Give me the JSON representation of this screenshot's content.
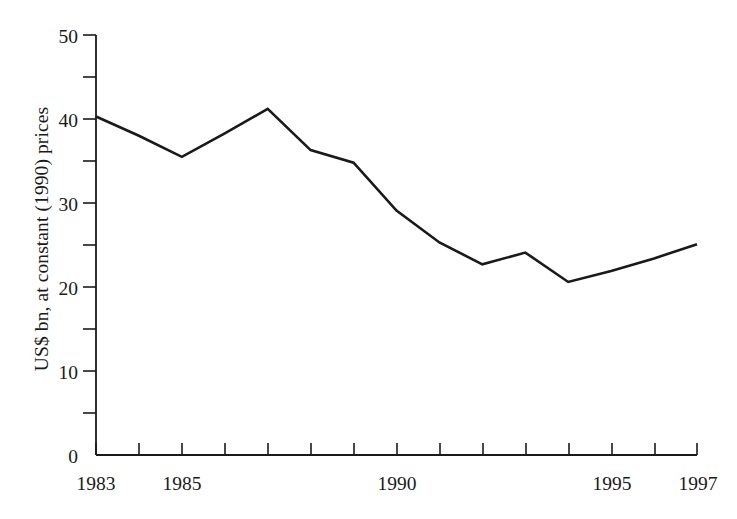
{
  "chart_data": {
    "type": "line",
    "title": "",
    "subtitle": "",
    "xlabel": "",
    "ylabel": "US$ bn, at constant (1990) prices",
    "x": [
      1983,
      1984,
      1985,
      1986,
      1987,
      1988,
      1989,
      1990,
      1991,
      1992,
      1993,
      1994,
      1995,
      1996,
      1997
    ],
    "values": [
      40.3,
      38.0,
      35.5,
      38.3,
      41.2,
      36.3,
      34.8,
      29.1,
      25.3,
      22.7,
      24.1,
      20.6,
      21.9,
      23.4,
      25.1
    ],
    "series": [
      {
        "name": "US$ bn, at constant (1990) prices",
        "values": [
          40.3,
          38.0,
          35.5,
          38.3,
          41.2,
          36.3,
          34.8,
          29.1,
          25.3,
          22.7,
          24.1,
          20.6,
          21.9,
          23.4,
          25.1
        ]
      }
    ],
    "xlim": [
      1983,
      1997
    ],
    "ylim": [
      0,
      50
    ],
    "x_tick_values": [
      1983,
      1984,
      1985,
      1986,
      1987,
      1988,
      1989,
      1990,
      1991,
      1992,
      1993,
      1994,
      1995,
      1996,
      1997
    ],
    "x_tick_labels_shown": [
      "1983",
      "1985",
      "1990",
      "1995",
      "1997"
    ],
    "x_tick_labels_shown_at": [
      1983,
      1985,
      1990,
      1995,
      1997
    ],
    "y_major_ticks": [
      0,
      10,
      20,
      30,
      40,
      50
    ],
    "y_major_tick_labels": [
      "0",
      "10",
      "20",
      "30",
      "40",
      "50"
    ],
    "y_minor_ticks": [
      5,
      15,
      25,
      35,
      45
    ],
    "grid": false,
    "legend": false,
    "legend_position": "none",
    "line_color": "#1a1a1a",
    "background_color": "#ffffff",
    "axis_color": "#1a1a1a",
    "annotations": []
  },
  "axes": {
    "y_title": "US$ bn, at constant (1990) prices",
    "y_labels": [
      "50",
      "40",
      "30",
      "20",
      "10",
      "0"
    ],
    "x_labels": [
      "1983",
      "1985",
      "1990",
      "1995",
      "1997"
    ]
  }
}
